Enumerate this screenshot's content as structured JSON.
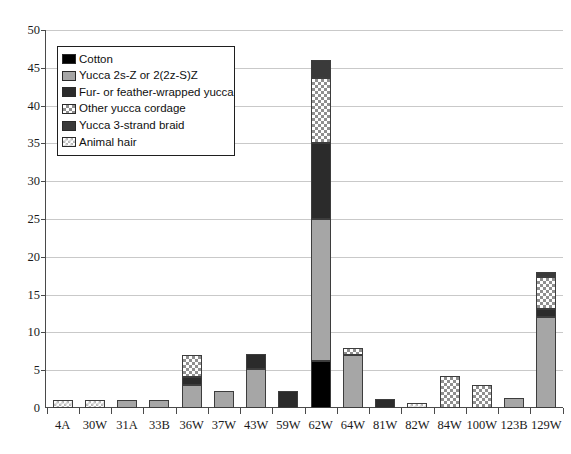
{
  "chart_data": {
    "type": "bar",
    "subtype": "stacked-bar",
    "title": "",
    "xlabel": "",
    "ylabel": "",
    "ylim": [
      0,
      50
    ],
    "ytick_step": 5,
    "yticks": [
      0,
      5,
      10,
      15,
      20,
      25,
      30,
      35,
      40,
      45,
      50
    ],
    "grid": "horizontal",
    "legend_position": "upper-left-inside",
    "categories": [
      "4A",
      "30W",
      "31A",
      "33B",
      "36W",
      "37W",
      "43W",
      "59W",
      "62W",
      "64W",
      "81W",
      "82W",
      "84W",
      "100W",
      "123B",
      "129W"
    ],
    "series": [
      {
        "name": "Cotton",
        "color": "#000000",
        "pattern": "solid",
        "values": [
          0,
          0,
          0,
          0,
          0,
          0,
          0,
          0,
          6.2,
          0,
          0,
          0,
          0,
          0,
          0,
          0
        ]
      },
      {
        "name": "Yucca 2s-Z or 2(2z-S)Z",
        "color": "#a6a6a6",
        "pattern": "solid",
        "values": [
          0,
          0,
          1.1,
          1.1,
          3.1,
          2.2,
          5.2,
          0,
          18.8,
          7.0,
          0,
          0,
          0,
          0,
          1.3,
          12.1
        ]
      },
      {
        "name": "Fur- or feather-wrapped yucca",
        "color": "#2b2b2b",
        "pattern": "solid",
        "values": [
          0,
          0,
          0,
          0,
          1.0,
          0,
          2.0,
          2.2,
          10.0,
          0,
          1.2,
          0,
          0,
          0,
          0,
          1.0
        ]
      },
      {
        "name": "Other yucca cordage",
        "color": "#ffffff",
        "pattern": "checkered",
        "values": [
          0,
          0,
          0,
          0,
          2.9,
          0,
          0,
          0,
          8.7,
          1.0,
          0,
          0,
          4.2,
          3.1,
          0,
          4.2
        ]
      },
      {
        "name": "Yucca 3-strand braid",
        "color": "#3a3a3a",
        "pattern": "solid",
        "values": [
          0,
          0,
          0,
          0,
          0,
          0,
          0,
          0,
          2.3,
          0,
          0,
          0,
          0,
          0,
          0,
          0.7
        ]
      },
      {
        "name": "Animal hair",
        "color": "#ffffff",
        "pattern": "light-checkered",
        "values": [
          1.1,
          1.1,
          0,
          0,
          0,
          0,
          0,
          0,
          0,
          0,
          0,
          0.6,
          0,
          0,
          0,
          0
        ]
      }
    ],
    "totals": [
      1.1,
      1.1,
      1.1,
      1.1,
      7.0,
      2.2,
      7.2,
      2.2,
      46.0,
      8.0,
      1.2,
      0.6,
      4.2,
      3.1,
      1.3,
      18.0
    ]
  },
  "legend": {
    "items": [
      {
        "label": "Cotton",
        "swatch": "cotton-swatch"
      },
      {
        "label": "Yucca 2s-Z or 2(2z-S)Z",
        "swatch": "yucca-2sz-swatch"
      },
      {
        "label": "Fur- or feather-wrapped yucca",
        "swatch": "fur-feather-swatch"
      },
      {
        "label": "Other yucca cordage",
        "swatch": "other-cordage-swatch"
      },
      {
        "label": "Yucca 3-strand braid",
        "swatch": "braid-swatch"
      },
      {
        "label": "Animal hair",
        "swatch": "animal-hair-swatch"
      }
    ]
  },
  "axes": {
    "y_tick_labels": [
      "0",
      "5",
      "10",
      "15",
      "20",
      "25",
      "30",
      "35",
      "40",
      "45",
      "50"
    ],
    "x_tick_labels": [
      "4A",
      "30W",
      "31A",
      "33B",
      "36W",
      "37W",
      "43W",
      "59W",
      "62W",
      "64W",
      "81W",
      "82W",
      "84W",
      "100W",
      "123B",
      "129W"
    ]
  },
  "colors": {
    "cotton": "#000000",
    "yucca_2sz": "#a6a6a6",
    "fur_feather": "#2b2b2b",
    "other_cordage": "#ffffff",
    "braid": "#3a3a3a",
    "animal_hair": "#ffffff",
    "axis": "#4a4a4a",
    "grid": "#c9c9c9"
  }
}
